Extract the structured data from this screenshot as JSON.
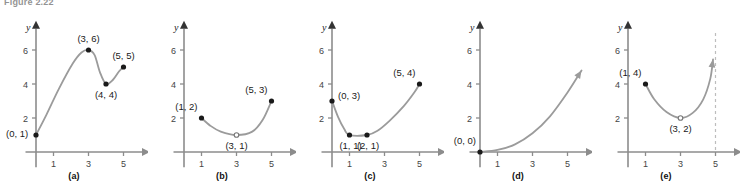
{
  "figure": {
    "caption": "Figure 2.22",
    "axis_x_label": "x",
    "axis_y_label": "y",
    "y_ticks": [
      2,
      4,
      6
    ],
    "x_ticks": [
      1,
      3,
      5
    ],
    "colors": {
      "curve": "#9b9b9b",
      "axis": "#8c8c8c",
      "point": "#1a1a1a",
      "dashed": "#bdbdbd",
      "text": "#1a1a1a"
    }
  },
  "chart_data": [
    {
      "type": "line",
      "panel": "a",
      "label": "(a)",
      "title": "",
      "xlabel": "x",
      "ylabel": "y",
      "xlim": [
        -0.6,
        6.4
      ],
      "ylim": [
        -0.9,
        7.6
      ],
      "xticks": [
        1,
        3,
        5
      ],
      "yticks": [
        2,
        4,
        6
      ],
      "grid": false,
      "x": [
        0,
        3,
        4,
        5
      ],
      "y": [
        1,
        6,
        4,
        5
      ],
      "points": [
        {
          "x": 0,
          "y": 1,
          "label": "(0, 1)",
          "filled": true,
          "label_pos": "left-below"
        },
        {
          "x": 3,
          "y": 6,
          "label": "(3, 6)",
          "filled": true,
          "label_pos": "above"
        },
        {
          "x": 4,
          "y": 4,
          "label": "(4, 4)",
          "filled": true,
          "label_pos": "below"
        },
        {
          "x": 5,
          "y": 5,
          "label": "(5, 5)",
          "filled": true,
          "label_pos": "above"
        }
      ],
      "arrow_end": false,
      "asymptote": null
    },
    {
      "type": "line",
      "panel": "b",
      "label": "(b)",
      "title": "",
      "xlabel": "x",
      "ylabel": "y",
      "xlim": [
        -0.6,
        6.4
      ],
      "ylim": [
        -0.9,
        7.6
      ],
      "xticks": [
        1,
        3,
        5
      ],
      "yticks": [
        2,
        4,
        6
      ],
      "grid": false,
      "x": [
        1,
        3,
        5
      ],
      "y": [
        2,
        1,
        3
      ],
      "points": [
        {
          "x": 1,
          "y": 2,
          "label": "(1, 2)",
          "filled": true,
          "label_pos": "above-left"
        },
        {
          "x": 3,
          "y": 1,
          "label": "(3, 1)",
          "filled": false,
          "label_pos": "below"
        },
        {
          "x": 5,
          "y": 3,
          "label": "(5, 3)",
          "filled": true,
          "label_pos": "above-left"
        }
      ],
      "arrow_end": false,
      "asymptote": null
    },
    {
      "type": "line",
      "panel": "c",
      "label": "(c)",
      "title": "",
      "xlabel": "x",
      "ylabel": "y",
      "xlim": [
        -0.6,
        6.4
      ],
      "ylim": [
        -0.9,
        7.6
      ],
      "xticks": [
        1,
        3,
        5
      ],
      "yticks": [
        2,
        4,
        6
      ],
      "grid": false,
      "x": [
        0,
        1,
        2,
        5
      ],
      "y": [
        3,
        1,
        1,
        4
      ],
      "points": [
        {
          "x": 0,
          "y": 3,
          "label": "(0, 3)",
          "filled": true,
          "label_pos": "right"
        },
        {
          "x": 1,
          "y": 1,
          "label": "(1, 1)",
          "filled": true,
          "label_pos": "below-left"
        },
        {
          "x": 2,
          "y": 1,
          "label": "(2, 1)",
          "filled": true,
          "label_pos": "below-right"
        },
        {
          "x": 5,
          "y": 4,
          "label": "(5, 4)",
          "filled": true,
          "label_pos": "above-left"
        }
      ],
      "arrow_end": false,
      "asymptote": null
    },
    {
      "type": "line",
      "panel": "d",
      "label": "(d)",
      "title": "",
      "xlabel": "x",
      "ylabel": "y",
      "xlim": [
        -0.6,
        6.4
      ],
      "ylim": [
        -0.9,
        7.6
      ],
      "xticks": [
        1,
        3,
        5
      ],
      "yticks": [
        2,
        4,
        6
      ],
      "grid": false,
      "x": [
        0,
        1,
        2,
        3,
        4,
        5,
        5.8
      ],
      "y": [
        0,
        0.12,
        0.45,
        1.1,
        2.1,
        3.5,
        4.8
      ],
      "points": [
        {
          "x": 0,
          "y": 0,
          "label": "(0, 0)",
          "filled": true,
          "label_pos": "above-left"
        }
      ],
      "arrow_end": true,
      "asymptote": null
    },
    {
      "type": "line",
      "panel": "e",
      "label": "(e)",
      "title": "",
      "xlabel": "x",
      "ylabel": "y",
      "xlim": [
        -0.6,
        6.4
      ],
      "ylim": [
        -0.9,
        7.6
      ],
      "xticks": [
        1,
        3,
        5
      ],
      "yticks": [
        2,
        4,
        6
      ],
      "grid": false,
      "x": [
        1,
        3,
        4.5,
        4.85
      ],
      "y": [
        4,
        2,
        3.4,
        5.6
      ],
      "points": [
        {
          "x": 1,
          "y": 4,
          "label": "(1, 4)",
          "filled": true,
          "label_pos": "above-left"
        },
        {
          "x": 3,
          "y": 2,
          "label": "(3, 2)",
          "filled": false,
          "label_pos": "below"
        }
      ],
      "arrow_end": true,
      "asymptote": {
        "x": 5,
        "style": "dashed"
      }
    }
  ]
}
